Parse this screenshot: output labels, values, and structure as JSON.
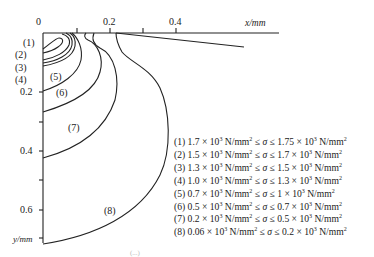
{
  "figure": {
    "x_axis": {
      "label": "x/mm",
      "ticks": [
        {
          "value": "0",
          "label": "0"
        },
        {
          "value": "0.1",
          "label": ""
        },
        {
          "value": "0.2",
          "label": "0.2"
        },
        {
          "value": "0.3",
          "label": ""
        },
        {
          "value": "0.4",
          "label": "0.4"
        }
      ]
    },
    "y_axis": {
      "label": "y/mm",
      "ticks": [
        {
          "value": "0.2",
          "label": "0.2"
        },
        {
          "value": "0.3",
          "label": ""
        },
        {
          "value": "0.4",
          "label": "0.4"
        },
        {
          "value": "0.5",
          "label": ""
        },
        {
          "value": "0.6",
          "label": "0.6"
        }
      ]
    },
    "curve_labels": [
      "(1)",
      "(2)",
      "(3)",
      "(4)",
      "(5)",
      "(6)",
      "(7)",
      "(8)"
    ],
    "legend": [
      {
        "id": "(1)",
        "low": "1.7",
        "high": "1.75"
      },
      {
        "id": "(2)",
        "low": "1.5",
        "high": "1.7"
      },
      {
        "id": "(3)",
        "low": "1.3",
        "high": "1.5"
      },
      {
        "id": "(4)",
        "low": "1.0",
        "high": "1.3"
      },
      {
        "id": "(5)",
        "low": "0.7",
        "high": "1"
      },
      {
        "id": "(6)",
        "low": "0.5",
        "high": "0.7"
      },
      {
        "id": "(7)",
        "low": "0.2",
        "high": "0.5"
      },
      {
        "id": "(8)",
        "low": "0.06",
        "high": "0.2"
      }
    ],
    "legend_unit": "× 10",
    "legend_exp": "3",
    "legend_units_text": " N/mm",
    "legend_units_exp": "2",
    "legend_relation": " ≤ σ ≤ ",
    "caption": "(...)"
  },
  "colors": {
    "line": "#222222",
    "background": "#ffffff"
  }
}
